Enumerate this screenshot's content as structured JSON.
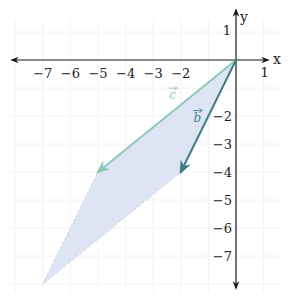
{
  "figure": {
    "origin_px": [
      236,
      60
    ],
    "unit_px_x": 27.6,
    "unit_px_y": 28.0,
    "x_axis": {
      "label": "x",
      "range": [
        -8,
        1
      ],
      "tick_labels": [
        {
          "value": -7,
          "text": "−7"
        },
        {
          "value": -6,
          "text": "−6"
        },
        {
          "value": -5,
          "text": "−5"
        },
        {
          "value": -4,
          "text": "−4"
        },
        {
          "value": -3,
          "text": "−3"
        },
        {
          "value": -2,
          "text": "−2"
        },
        {
          "value": 1,
          "text": "1"
        }
      ]
    },
    "y_axis": {
      "label": "y",
      "range": [
        -8,
        1
      ],
      "tick_labels": [
        {
          "value": 1,
          "text": "1"
        },
        {
          "value": -2,
          "text": "−2"
        },
        {
          "value": -3,
          "text": "−3"
        },
        {
          "value": -4,
          "text": "−4"
        },
        {
          "value": -5,
          "text": "−5"
        },
        {
          "value": -6,
          "text": "−6"
        },
        {
          "value": -7,
          "text": "−7"
        }
      ]
    },
    "vectors": [
      {
        "name": "c",
        "label": "c",
        "from": [
          0,
          0
        ],
        "to": [
          -5,
          -4
        ],
        "color": "#8cc9b8",
        "label_pos": [
          -2.3,
          -1.4
        ]
      },
      {
        "name": "b",
        "label": "b",
        "from": [
          0,
          0
        ],
        "to": [
          -2,
          -4
        ],
        "color": "#3e7f86",
        "label_pos": [
          -1.4,
          -2.2
        ]
      }
    ],
    "parallelogram": {
      "vertices": [
        [
          0,
          0
        ],
        [
          -5,
          -4
        ],
        [
          -7,
          -8
        ],
        [
          -2,
          -4
        ]
      ],
      "fill": "#dfe4f4",
      "edge_color": "#c9d0ea"
    },
    "axis_color": "#1a1a1a",
    "grid_color": "#f2f2f2"
  }
}
